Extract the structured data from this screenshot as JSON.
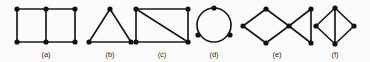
{
  "figure": {
    "width": 370,
    "height": 62,
    "background_color": "#fbfbfb",
    "stroke_color": "#1a1a1a",
    "vertex_color": "#111111",
    "label_color": "#2a2a2a",
    "caption_row_y": 50
  },
  "panels": [
    {
      "id": "a",
      "label": "(a)",
      "label_x": 46,
      "description": "ladder graph: two adjacent squares, 6 vertices, 7 edges",
      "vertex_count": 6,
      "edge_count": 7,
      "vertices": [
        {
          "x": 17,
          "y": 9
        },
        {
          "x": 46,
          "y": 9
        },
        {
          "x": 75,
          "y": 9
        },
        {
          "x": 17,
          "y": 42
        },
        {
          "x": 46,
          "y": 42
        },
        {
          "x": 75,
          "y": 42
        }
      ],
      "edges": [
        [
          0,
          1
        ],
        [
          1,
          2
        ],
        [
          3,
          4
        ],
        [
          4,
          5
        ],
        [
          0,
          3
        ],
        [
          1,
          4
        ],
        [
          2,
          5
        ]
      ],
      "arcs": []
    },
    {
      "id": "b",
      "label": "(b)",
      "label_x": 110,
      "description": "triangle, 3 vertices, 3 edges",
      "vertex_count": 3,
      "edge_count": 3,
      "vertices": [
        {
          "x": 110,
          "y": 9
        },
        {
          "x": 89,
          "y": 42
        },
        {
          "x": 131,
          "y": 42
        }
      ],
      "edges": [
        [
          0,
          1
        ],
        [
          1,
          2
        ],
        [
          2,
          0
        ]
      ],
      "arcs": []
    },
    {
      "id": "c",
      "label": "(c)",
      "label_x": 162,
      "description": "rectangle with one diagonal, 4 vertices, 5 edges",
      "vertex_count": 4,
      "edge_count": 5,
      "vertices": [
        {
          "x": 136,
          "y": 9
        },
        {
          "x": 188,
          "y": 9
        },
        {
          "x": 188,
          "y": 42
        },
        {
          "x": 136,
          "y": 42
        }
      ],
      "edges": [
        [
          0,
          1
        ],
        [
          1,
          2
        ],
        [
          2,
          3
        ],
        [
          3,
          0
        ],
        [
          0,
          2
        ]
      ],
      "arcs": []
    },
    {
      "id": "d",
      "label": "(d)",
      "label_x": 214,
      "description": "circle drawn through 3 vertices, 3 vertices, 3 arc edges",
      "vertex_count": 3,
      "edge_count": 3,
      "vertices": [
        {
          "x": 214,
          "y": 8
        },
        {
          "x": 198,
          "y": 35
        },
        {
          "x": 230,
          "y": 35
        }
      ],
      "edges": [],
      "arcs": [
        {
          "cx": 214,
          "cy": 25,
          "r": 17
        }
      ]
    },
    {
      "id": "e",
      "label": "(e)",
      "label_x": 277,
      "description": "diamond joined at a cut vertex to a triangle, 6 vertices, 7 edges",
      "vertex_count": 6,
      "edge_count": 7,
      "vertices": [
        {
          "x": 243,
          "y": 26
        },
        {
          "x": 266,
          "y": 9
        },
        {
          "x": 289,
          "y": 26
        },
        {
          "x": 266,
          "y": 43
        },
        {
          "x": 311,
          "y": 9
        },
        {
          "x": 311,
          "y": 43
        }
      ],
      "edges": [
        [
          0,
          1
        ],
        [
          1,
          2
        ],
        [
          2,
          3
        ],
        [
          3,
          0
        ],
        [
          2,
          4
        ],
        [
          2,
          5
        ],
        [
          4,
          5
        ]
      ],
      "arcs": []
    },
    {
      "id": "f",
      "label": "(f)",
      "label_x": 335,
      "description": "diamond with vertical chord, 4 vertices, 5 edges",
      "vertex_count": 4,
      "edge_count": 5,
      "vertices": [
        {
          "x": 335,
          "y": 8
        },
        {
          "x": 354,
          "y": 26
        },
        {
          "x": 335,
          "y": 44
        },
        {
          "x": 316,
          "y": 26
        }
      ],
      "edges": [
        [
          0,
          1
        ],
        [
          1,
          2
        ],
        [
          2,
          3
        ],
        [
          3,
          0
        ],
        [
          0,
          2
        ]
      ],
      "arcs": []
    }
  ]
}
